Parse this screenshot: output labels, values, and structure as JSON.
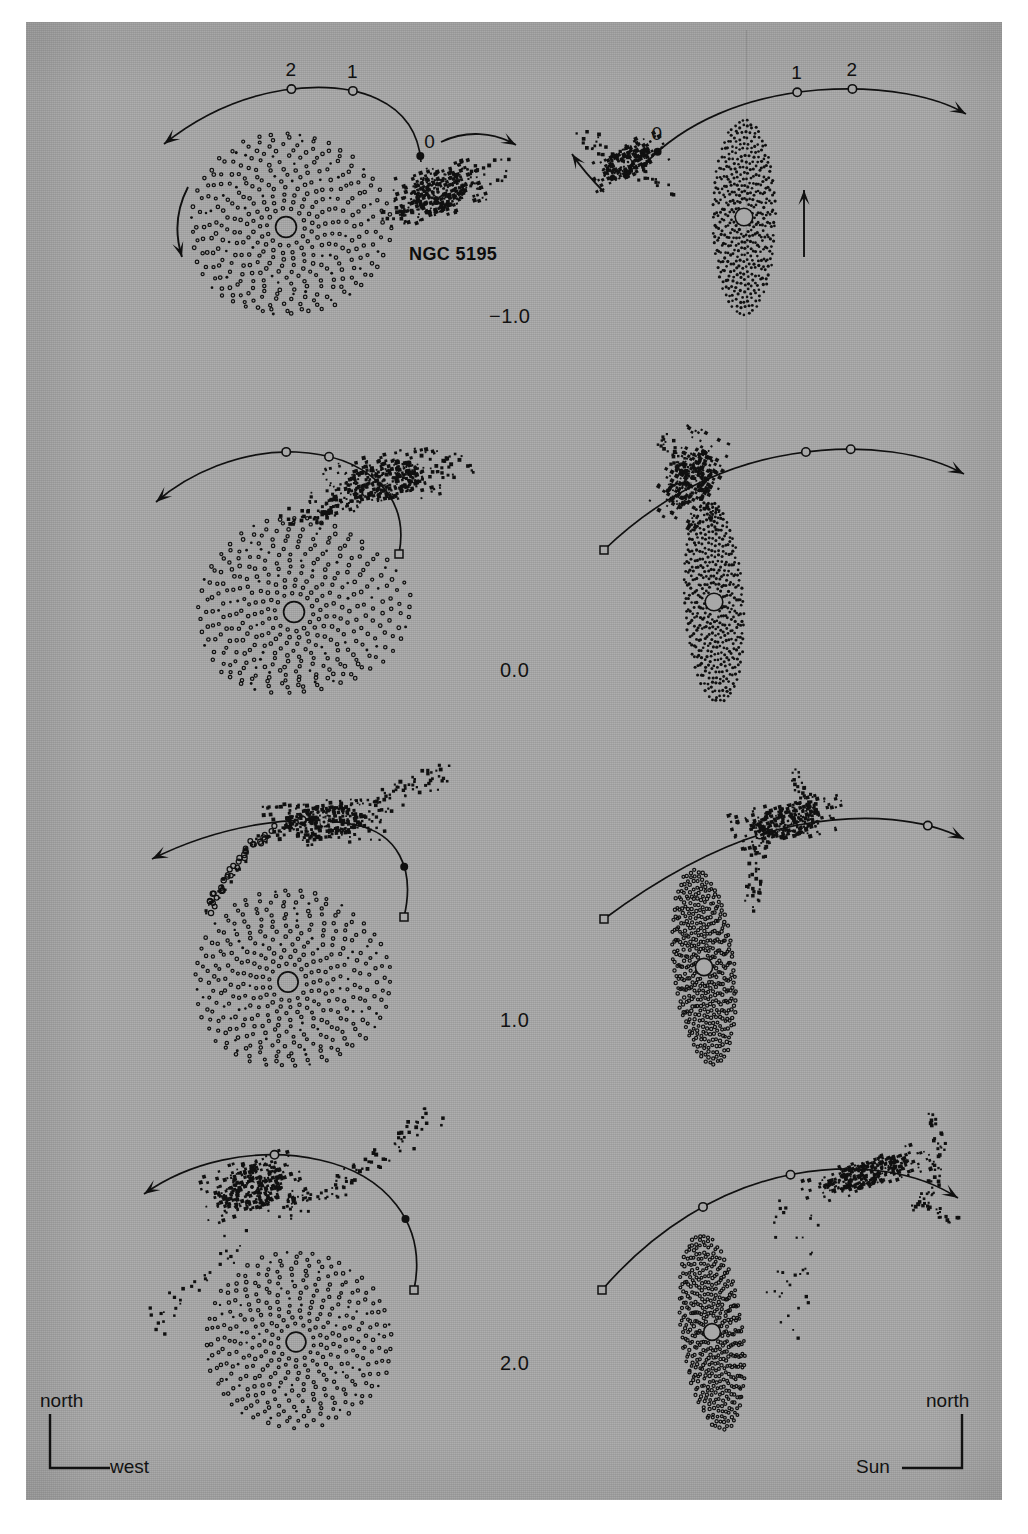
{
  "figure": {
    "subject": "NGC 5195",
    "companion_label": "NGC 5195",
    "orbit_tick_labels": [
      "0",
      "1",
      "2"
    ],
    "time_labels": [
      "−1.0",
      "0.0",
      "1.0",
      "2.0"
    ],
    "background_color": "#a8a8a8",
    "ink_color": "#101010",
    "left_column_view": "sky-plane-view",
    "right_column_view": "edge-on-view"
  },
  "compass_left": {
    "vertical_label": "north",
    "horizontal_label": "west"
  },
  "compass_right": {
    "vertical_label": "north",
    "horizontal_label": "Sun"
  },
  "rows": [
    {
      "time": "−1.0",
      "left": {
        "disk": "face-on-spiral-disk",
        "companion": "clumpy-companion",
        "orbit": "companion-orbit-track",
        "spin_arrow": "disk-spin-arrow",
        "companion_arrow": "companion-motion-arrow",
        "ticks_labeled": true
      },
      "right": {
        "disk": "edge-on-disk",
        "companion": "clumpy-companion",
        "orbit": "companion-orbit-track",
        "spin_arrow": "disk-spin-arrow",
        "companion_arrow": "companion-motion-arrow",
        "ticks_labeled": true
      }
    },
    {
      "time": "0.0",
      "left": {
        "disk": "face-on-spiral-disk",
        "companion": "clumpy-companion",
        "orbit": "companion-orbit-track",
        "ticks_labeled": false
      },
      "right": {
        "disk": "edge-on-disk",
        "companion": "clumpy-companion",
        "orbit": "companion-orbit-track",
        "ticks_labeled": false
      }
    },
    {
      "time": "1.0",
      "left": {
        "disk": "face-on-spiral-disk",
        "companion": "clumpy-companion",
        "orbit": "companion-orbit-track",
        "ticks_labeled": false
      },
      "right": {
        "disk": "edge-on-disk",
        "companion": "clumpy-companion",
        "orbit": "companion-orbit-track",
        "ticks_labeled": false
      }
    },
    {
      "time": "2.0",
      "left": {
        "disk": "face-on-spiral-disk",
        "companion": "clumpy-companion",
        "orbit": "companion-orbit-track",
        "ticks_labeled": false
      },
      "right": {
        "disk": "edge-on-disk",
        "companion": "clumpy-companion",
        "orbit": "companion-orbit-track",
        "ticks_labeled": false
      }
    }
  ],
  "chart_data": {
    "type": "scatter",
    "title": "",
    "xlabel": "",
    "ylabel": "",
    "panels": [
      {
        "row": 0,
        "column": "left",
        "time": -1.0,
        "projection": "plane of sky",
        "n_disk_particles": 420,
        "n_companion_particles": 260,
        "orbit_ticks": [
          0,
          1,
          2
        ]
      },
      {
        "row": 0,
        "column": "right",
        "time": -1.0,
        "projection": "edge-on",
        "n_disk_particles": 420,
        "n_companion_particles": 260,
        "orbit_ticks": [
          0,
          1,
          2
        ]
      },
      {
        "row": 1,
        "column": "left",
        "time": 0.0,
        "projection": "plane of sky",
        "n_disk_particles": 420,
        "n_companion_particles": 300,
        "orbit_ticks": [
          1,
          2
        ]
      },
      {
        "row": 1,
        "column": "right",
        "time": 0.0,
        "projection": "edge-on",
        "n_disk_particles": 420,
        "n_companion_particles": 300,
        "orbit_ticks": [
          1,
          2
        ]
      },
      {
        "row": 2,
        "column": "left",
        "time": 1.0,
        "projection": "plane of sky",
        "n_disk_particles": 420,
        "n_companion_particles": 300,
        "orbit_ticks": [
          0,
          1
        ]
      },
      {
        "row": 2,
        "column": "right",
        "time": 1.0,
        "projection": "edge-on",
        "n_disk_particles": 420,
        "n_companion_particles": 300,
        "orbit_ticks": [
          0,
          1
        ]
      },
      {
        "row": 3,
        "column": "left",
        "time": 2.0,
        "projection": "plane of sky",
        "n_disk_particles": 420,
        "n_companion_particles": 300,
        "orbit_ticks": [
          0,
          1
        ]
      },
      {
        "row": 3,
        "column": "right",
        "time": 2.0,
        "projection": "edge-on",
        "n_disk_particles": 420,
        "n_companion_particles": 300,
        "orbit_ticks": [
          0,
          1
        ]
      }
    ],
    "time_sequence": [
      -1.0,
      0.0,
      1.0,
      2.0
    ],
    "legend": [],
    "grid": false
  }
}
